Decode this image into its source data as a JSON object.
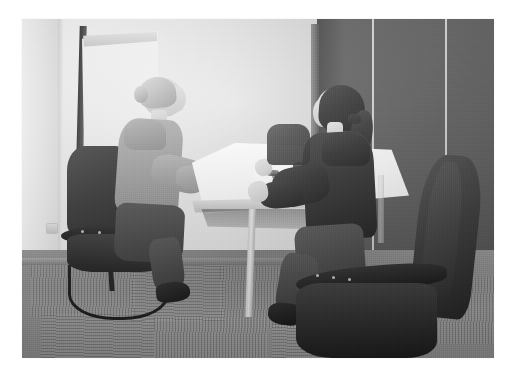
{
  "image": {
    "kind": "photograph",
    "palette": "grayscale",
    "caption": "Two women seated facing each other across a white table in an office meeting room",
    "frame": {
      "background_color": "#ffffff",
      "left": 22,
      "top": 19,
      "width": 472,
      "height": 339
    }
  },
  "scene": {
    "setting_label": "office meeting room",
    "wall": {
      "name": "back wall",
      "color": "#e6e4e0"
    },
    "partition": {
      "name": "fabric partition panels",
      "color": "#545454",
      "panel_count": 3
    },
    "floor": {
      "name": "carpet tiles",
      "color": "#97948e",
      "pattern": "linear pile, alternating direction"
    },
    "baseboard_color": "#a9a6a0"
  },
  "objects": {
    "flipchart": {
      "label": "flipchart easel",
      "paper_color": "#f7f6f3",
      "frame_color": "#2e2e2e"
    },
    "table": {
      "label": "white meeting table",
      "top_color": "#f6f5f3",
      "leg_color": "#d2cfc9"
    },
    "document": {
      "label": "paper document on table",
      "color": "#ffffff"
    },
    "chair_left": {
      "label": "cantilever visitor chair",
      "color": "#2b2a28"
    },
    "chair_right": {
      "label": "foreground office chair",
      "color": "#2f2d2b"
    },
    "wall_outlet": {
      "label": "wall power outlet",
      "color": "#d8d5d0"
    }
  },
  "people": [
    {
      "id": "woman-left",
      "label": "woman facing right",
      "hair": "blonde hair in a low bun",
      "hair_color": "#cdc2ad",
      "clothing": "light grey long-sleeve top",
      "clothing_color": "#a39e97",
      "lower_clothing": "dark trousers",
      "posture": "seated, leaning toward table, hands on table"
    },
    {
      "id": "woman-right",
      "label": "woman facing left",
      "hair": "dark hair in a ponytail",
      "hair_color": "#332b27",
      "clothing": "dark jacket",
      "clothing_color": "#2a2724",
      "lower_clothing": "dark trousers",
      "posture": "seated, hands resting on table edge"
    }
  ]
}
